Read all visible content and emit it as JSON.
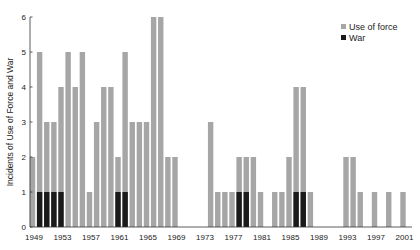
{
  "chart_data": {
    "type": "bar",
    "stacked": false,
    "overlay": true,
    "title": "",
    "xlabel": "",
    "ylabel": "Incidents of Use of Force and War",
    "ylim": [
      0,
      6
    ],
    "yticks": [
      0,
      1,
      2,
      3,
      4,
      5,
      6
    ],
    "xtick_labels": [
      "1949",
      "1953",
      "1957",
      "1961",
      "1965",
      "1969",
      "1973",
      "1977",
      "1981",
      "1985",
      "1989",
      "1993",
      "1997",
      "2001"
    ],
    "grid": false,
    "legend_position": "upper right",
    "categories": [
      1949,
      1950,
      1951,
      1952,
      1953,
      1954,
      1955,
      1956,
      1957,
      1958,
      1959,
      1960,
      1961,
      1962,
      1963,
      1964,
      1965,
      1966,
      1967,
      1968,
      1969,
      1970,
      1971,
      1972,
      1973,
      1974,
      1975,
      1976,
      1977,
      1978,
      1979,
      1980,
      1981,
      1982,
      1983,
      1984,
      1985,
      1986,
      1987,
      1988,
      1989,
      1990,
      1991,
      1992,
      1993,
      1994,
      1995,
      1996,
      1997,
      1998,
      1999,
      2000,
      2001
    ],
    "series": [
      {
        "name": "Use of force",
        "color": "#a6a6a6",
        "values": [
          2,
          5,
          3,
          3,
          4,
          5,
          4,
          5,
          1,
          3,
          4,
          4,
          2,
          5,
          3,
          3,
          3,
          6,
          6,
          2,
          2,
          0,
          0,
          0,
          0,
          3,
          1,
          1,
          1,
          2,
          2,
          2,
          1,
          0,
          1,
          1,
          2,
          4,
          4,
          1,
          0,
          0,
          0,
          0,
          2,
          2,
          1,
          0,
          1,
          0,
          1,
          0,
          1
        ]
      },
      {
        "name": "War",
        "color": "#1a1a1a",
        "values": [
          0,
          1,
          1,
          1,
          1,
          0,
          0,
          0,
          0,
          0,
          0,
          0,
          1,
          1,
          0,
          0,
          0,
          0,
          0,
          0,
          0,
          0,
          0,
          0,
          0,
          0,
          0,
          0,
          0,
          1,
          1,
          0,
          0,
          0,
          0,
          0,
          0,
          1,
          1,
          0,
          0,
          0,
          0,
          0,
          0,
          0,
          0,
          0,
          0,
          0,
          0,
          0,
          0
        ]
      }
    ]
  }
}
